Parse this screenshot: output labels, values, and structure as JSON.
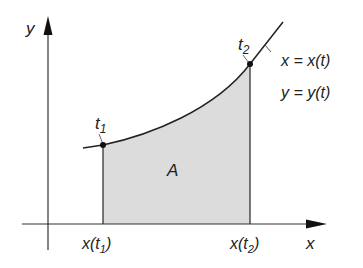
{
  "diagram": {
    "axes": {
      "x_label": "x",
      "y_label": "y"
    },
    "points": {
      "t1_label": "t",
      "t1_sub": "1",
      "t2_label": "t",
      "t2_sub": "2"
    },
    "equations": {
      "x_eq": "x = x(t)",
      "y_eq": "y = y(t)"
    },
    "area_label": "A",
    "ticks": {
      "x_t1_pre": "x(t",
      "x_t1_sub": "1",
      "x_t1_post": ")",
      "x_t2_pre": "x(t",
      "x_t2_sub": "2",
      "x_t2_post": ")"
    },
    "colors": {
      "fill": "#dcdcdc",
      "stroke": "#222222",
      "axis": "#333333"
    }
  }
}
